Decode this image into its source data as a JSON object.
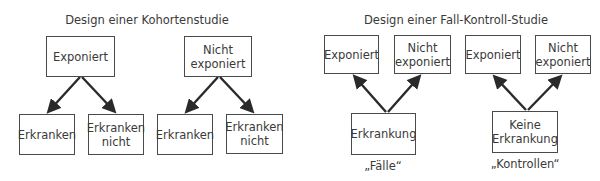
{
  "cohort": {
    "title": "Design einer Kohortenstudie",
    "groups": [
      {
        "label": "Exponiert",
        "outcomes": [
          "Erkranken",
          "Erkranken nicht"
        ]
      },
      {
        "label": "Nicht exponiert",
        "outcomes": [
          "Erkranken",
          "Erkranken nicht"
        ]
      }
    ],
    "boxes": {
      "exposed": "Exponiert",
      "not_exposed": "Nicht exponiert",
      "exp_sick": "Erkranken",
      "exp_not_sick": "Erkranken nicht",
      "nexp_sick": "Erkranken",
      "nexp_not_sick": "Erkranken nicht"
    }
  },
  "case_control": {
    "title": "Design einer Fall-Kontroll-Studie",
    "groups": [
      {
        "label": "Erkrankung",
        "caption": "„Fälle“",
        "exposures": [
          "Exponiert",
          "Nicht exponiert"
        ]
      },
      {
        "label": "Keine Erkrankung",
        "caption": "„Kontrollen“",
        "exposures": [
          "Exponiert",
          "Nicht exponiert"
        ]
      }
    ],
    "boxes": {
      "cases_exposed": "Exponiert",
      "cases_not_exposed": "Nicht exponiert",
      "controls_exposed": "Exponiert",
      "controls_not_exposed": "Nicht exponiert",
      "cases": "Erkrankung",
      "controls": "Keine Erkrankung"
    },
    "captions": {
      "cases": "„Fälle“",
      "controls": "„Kontrollen“"
    }
  },
  "colors": {
    "line": "#2a2a2a",
    "box_border": "#4a4a4a",
    "text": "#3a3a3a"
  }
}
